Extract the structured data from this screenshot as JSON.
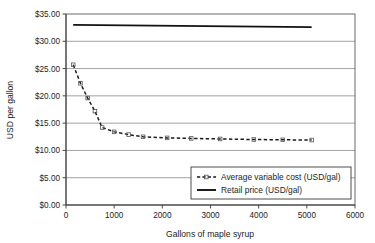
{
  "chart_data": {
    "type": "line",
    "title": "",
    "xlabel": "Gallons of maple syrup",
    "ylabel": "USD per gallon",
    "xlim": [
      0,
      6000
    ],
    "ylim": [
      0,
      35
    ],
    "grid": true,
    "legend_position": "bottom-right-inside",
    "xticks": [
      "0",
      "1000",
      "2000",
      "3000",
      "4000",
      "5000",
      "6000"
    ],
    "xtick_values": [
      0,
      1000,
      2000,
      3000,
      4000,
      5000,
      6000
    ],
    "yticks": [
      "$0.00",
      "$5.00",
      "$10.00",
      "$15.00",
      "$20.00",
      "$25.00",
      "$30.00",
      "$35.00"
    ],
    "ytick_values": [
      0,
      5,
      10,
      15,
      20,
      25,
      30,
      35
    ],
    "series": [
      {
        "name": "Average variable cost (USD/gal)",
        "style": "dashed",
        "marker": "small-square",
        "x": [
          150,
          300,
          450,
          600,
          750,
          1000,
          1300,
          1600,
          2100,
          2600,
          3200,
          3900,
          4500,
          5100
        ],
        "values": [
          25.7,
          22.3,
          19.6,
          17.2,
          14.2,
          13.4,
          12.9,
          12.5,
          12.3,
          12.2,
          12.1,
          12.0,
          11.95,
          11.9
        ]
      },
      {
        "name": "Retail price (USD/gal)",
        "style": "solid",
        "marker": "none",
        "x": [
          150,
          5100
        ],
        "values": [
          33.0,
          32.6
        ]
      }
    ]
  },
  "legend": {
    "items": [
      {
        "label": "Average variable cost (USD/gal)",
        "style": "dashed"
      },
      {
        "label": "Retail price (USD/gal)",
        "style": "solid"
      }
    ]
  },
  "axes": {
    "y_title": "USD per gallon",
    "x_title": "Gallons of maple syrup"
  }
}
